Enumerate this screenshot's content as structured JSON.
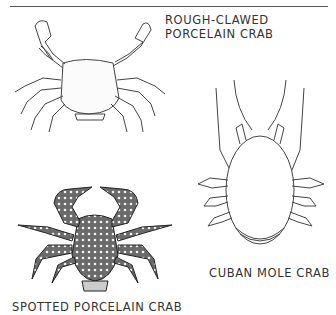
{
  "page": {
    "figures": [
      {
        "name": "rough-clawed-porcelain-crab",
        "label_lines": [
          "ROUGH-CLAWED",
          "PORCELAIN CRAB"
        ]
      },
      {
        "name": "cuban-mole-crab",
        "label": "CUBAN MOLE CRAB"
      },
      {
        "name": "spotted-porcelain-crab",
        "label": "SPOTTED PORCELAIN CRAB"
      }
    ]
  }
}
